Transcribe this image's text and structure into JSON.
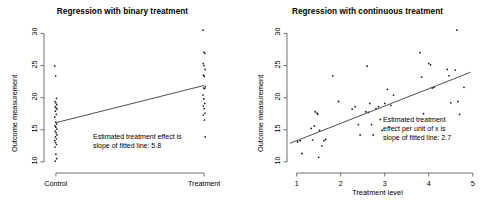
{
  "figure": {
    "background": "#ffffff",
    "axis_color": "#4d4d4d",
    "point_color": "#1a1a1a",
    "line_color": "#3b3b3b"
  },
  "panels": [
    {
      "id": "binary",
      "title": "Regression with binary treatment",
      "xlabel": "",
      "ylabel": "Outcome measurement",
      "xticks": [
        "Control",
        "Treatment"
      ],
      "yticks": [
        "10",
        "15",
        "20",
        "25",
        "30"
      ],
      "annotation_line1": "Estimated treatment effect is",
      "annotation_line2": "slope of fitted line:  5.8"
    },
    {
      "id": "continuous",
      "title": "Regression with continuous treatment",
      "xlabel": "Treatment level",
      "ylabel": "Outcome measurement",
      "xticks": [
        "1",
        "2",
        "3",
        "4",
        "5"
      ],
      "yticks": [
        "10",
        "15",
        "20",
        "25",
        "30"
      ],
      "annotation_line1": "Estimated treatment",
      "annotation_line2": "effect per unit of x is",
      "annotation_line3": "slope of fitted line:  2.7"
    }
  ],
  "chart_data": [
    {
      "type": "scatter",
      "title": "Regression with binary treatment",
      "xlabel": "",
      "ylabel": "Outcome measurement",
      "xticklabels": [
        "Control",
        "Treatment"
      ],
      "xtickvalues": [
        0,
        1
      ],
      "xlim": [
        -0.08,
        1.08
      ],
      "ylim": [
        9.2,
        31.0
      ],
      "yticks": [
        10,
        15,
        20,
        25,
        30
      ],
      "grid": false,
      "legend": null,
      "annotations": [
        {
          "text": "Estimated treatment effect is slope of fitted line:  5.8",
          "x": 0.33,
          "y": 13.6
        }
      ],
      "fit_line": {
        "slope": 5.8,
        "intercept": 16.1,
        "x": [
          0,
          1
        ],
        "y": [
          16.1,
          21.9
        ]
      },
      "series": [
        {
          "name": "Control",
          "x_category": "Control",
          "x": 0,
          "values": [
            24.9,
            23.4,
            19.9,
            19.4,
            19.2,
            18.9,
            18.6,
            18.4,
            18.2,
            17.9,
            17.4,
            17.0,
            16.2,
            15.9,
            15.6,
            15.4,
            15.1,
            14.8,
            14.5,
            14.2,
            13.9,
            13.6,
            13.3,
            13.0,
            12.7,
            12.3,
            11.2,
            10.5,
            10.1
          ]
        },
        {
          "name": "Treatment",
          "x_category": "Treatment",
          "x": 1,
          "values": [
            30.5,
            27.1,
            26.9,
            25.3,
            25.0,
            24.4,
            23.5,
            23.3,
            21.7,
            21.5,
            21.4,
            20.4,
            19.8,
            19.1,
            18.7,
            18.3,
            17.6,
            17.3,
            16.5,
            13.9
          ]
        }
      ]
    },
    {
      "type": "scatter",
      "title": "Regression with continuous treatment",
      "xlabel": "Treatment level",
      "ylabel": "Outcome measurement",
      "xticks": [
        1,
        2,
        3,
        4,
        5
      ],
      "yticks": [
        10,
        15,
        20,
        25,
        30
      ],
      "xlim": [
        0.78,
        5.05
      ],
      "ylim": [
        9.2,
        31.0
      ],
      "grid": false,
      "legend": null,
      "annotations": [
        {
          "text": "Estimated treatment effect per unit of x is slope of fitted line:  2.7",
          "x": 3.0,
          "y": 16.7
        }
      ],
      "fit_line": {
        "slope": 2.7,
        "intercept": 10.6,
        "x": [
          0.85,
          4.95
        ],
        "y": [
          12.9,
          23.95
        ]
      },
      "points": [
        [
          1.02,
          13.1
        ],
        [
          1.08,
          13.3
        ],
        [
          1.12,
          11.3
        ],
        [
          1.33,
          15.2
        ],
        [
          1.36,
          13.4
        ],
        [
          1.4,
          15.6
        ],
        [
          1.42,
          17.8
        ],
        [
          1.46,
          17.6
        ],
        [
          1.48,
          17.4
        ],
        [
          1.5,
          10.7
        ],
        [
          1.52,
          14.9
        ],
        [
          1.57,
          12.5
        ],
        [
          1.62,
          13.3
        ],
        [
          1.66,
          13.5
        ],
        [
          1.82,
          23.4
        ],
        [
          1.95,
          19.4
        ],
        [
          2.26,
          18.2
        ],
        [
          2.33,
          18.6
        ],
        [
          2.4,
          15.8
        ],
        [
          2.44,
          14.2
        ],
        [
          2.57,
          17.8
        ],
        [
          2.6,
          24.9
        ],
        [
          2.63,
          17.7
        ],
        [
          2.66,
          19.1
        ],
        [
          2.7,
          15.8
        ],
        [
          2.74,
          14.2
        ],
        [
          2.8,
          18.3
        ],
        [
          2.86,
          18.6
        ],
        [
          2.9,
          16.6
        ],
        [
          2.94,
          14.9
        ],
        [
          3.0,
          19.1
        ],
        [
          3.06,
          21.3
        ],
        [
          3.14,
          18.8
        ],
        [
          3.2,
          20.4
        ],
        [
          3.8,
          27.0
        ],
        [
          3.84,
          23.2
        ],
        [
          3.88,
          17.5
        ],
        [
          4.0,
          25.3
        ],
        [
          4.04,
          25.1
        ],
        [
          4.08,
          21.5
        ],
        [
          4.12,
          21.6
        ],
        [
          4.42,
          24.4
        ],
        [
          4.46,
          23.4
        ],
        [
          4.5,
          19.2
        ],
        [
          4.6,
          24.3
        ],
        [
          4.64,
          30.5
        ],
        [
          4.66,
          19.4
        ],
        [
          4.7,
          17.4
        ],
        [
          4.8,
          21.6
        ]
      ]
    }
  ]
}
